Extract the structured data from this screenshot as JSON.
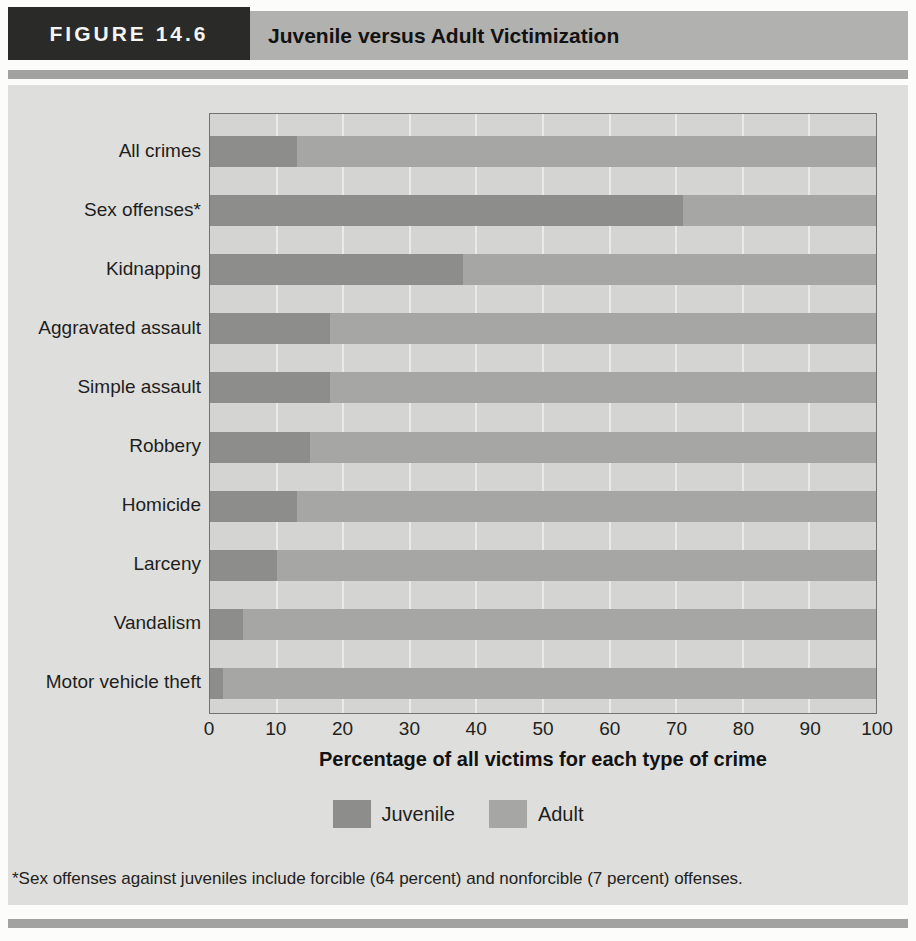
{
  "figure": {
    "label": "FIGURE 14.6",
    "title": "Juvenile versus Adult Victimization"
  },
  "chart_data": {
    "type": "bar",
    "orientation": "horizontal",
    "stacked": true,
    "categories": [
      "All crimes",
      "Sex offenses*",
      "Kidnapping",
      "Aggravated assault",
      "Simple assault",
      "Robbery",
      "Homicide",
      "Larceny",
      "Vandalism",
      "Motor vehicle theft"
    ],
    "series": [
      {
        "name": "Juvenile",
        "color": "#8d8d8b",
        "values": [
          13,
          71,
          38,
          18,
          18,
          15,
          13,
          10,
          5,
          2
        ]
      },
      {
        "name": "Adult",
        "color": "#a6a6a4",
        "values": [
          87,
          29,
          62,
          82,
          82,
          85,
          87,
          90,
          95,
          98
        ]
      }
    ],
    "xlabel": "Percentage of all victims for each type of crime",
    "xlim": [
      0,
      100
    ],
    "x_ticks": [
      0,
      10,
      20,
      30,
      40,
      50,
      60,
      70,
      80,
      90,
      100
    ],
    "grid": true,
    "legend_position": "bottom"
  },
  "legend": {
    "items": [
      {
        "label": "Juvenile",
        "color": "#8d8d8b"
      },
      {
        "label": "Adult",
        "color": "#a6a6a4"
      }
    ]
  },
  "footnote": "*Sex offenses against juveniles include forcible (64 percent) and nonforcible (7 percent) offenses.",
  "colors": {
    "juvenile": "#8d8d8b",
    "adult": "#a6a6a4",
    "plot_background": "#d4d4d2",
    "body_background": "#dededc",
    "header_box": "#2a2a28",
    "header_bar": "#b1b1af",
    "rule": "#a2a2a0"
  }
}
